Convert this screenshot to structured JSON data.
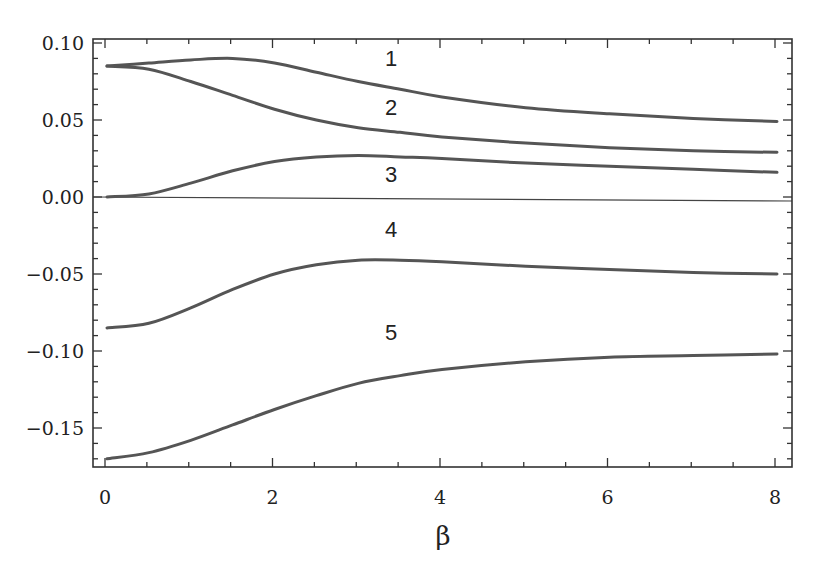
{
  "chart_data": {
    "type": "line",
    "title": "",
    "xlabel": "β",
    "ylabel": "",
    "xlim": [
      -0.1,
      8.2
    ],
    "ylim": [
      -0.175,
      0.105
    ],
    "grid": false,
    "legend": "none (curves labeled inline 1–5)",
    "x_ticks": [
      "0",
      "2",
      "4",
      "6",
      "8"
    ],
    "y_ticks": [
      "0.10",
      "0.05",
      "0.00",
      "-0.05",
      "-0.10",
      "-0.15"
    ],
    "x": [
      0,
      0.5,
      1,
      1.5,
      2,
      2.5,
      3,
      3.5,
      4,
      5,
      6,
      7,
      8
    ],
    "series": [
      {
        "name": "1",
        "values": [
          0.085,
          0.087,
          0.089,
          0.09,
          0.087,
          0.081,
          0.075,
          0.07,
          0.065,
          0.058,
          0.054,
          0.051,
          0.049
        ],
        "label_pos": [
          3.5,
          0.085
        ]
      },
      {
        "name": "2",
        "values": [
          0.085,
          0.083,
          0.075,
          0.066,
          0.057,
          0.05,
          0.045,
          0.042,
          0.039,
          0.035,
          0.032,
          0.03,
          0.029
        ],
        "label_pos": [
          3.5,
          0.053
        ]
      },
      {
        "name": "3",
        "values": [
          0.0,
          0.002,
          0.009,
          0.017,
          0.023,
          0.026,
          0.027,
          0.026,
          0.025,
          0.022,
          0.02,
          0.018,
          0.016
        ],
        "label_pos": [
          3.5,
          0.01
        ]
      },
      {
        "name": "4",
        "values": [
          -0.085,
          -0.082,
          -0.072,
          -0.06,
          -0.05,
          -0.044,
          -0.041,
          -0.041,
          -0.042,
          -0.045,
          -0.047,
          -0.049,
          -0.05
        ],
        "label_pos": [
          3.5,
          -0.026
        ]
      },
      {
        "name": "5",
        "values": [
          -0.17,
          -0.166,
          -0.158,
          -0.148,
          -0.138,
          -0.129,
          -0.121,
          -0.116,
          -0.112,
          -0.107,
          -0.104,
          -0.103,
          -0.102
        ],
        "label_pos": [
          3.5,
          -0.093
        ]
      }
    ],
    "reference_line": {
      "y": 0,
      "label": "zero line"
    }
  },
  "axes": {
    "x_title": "β"
  }
}
